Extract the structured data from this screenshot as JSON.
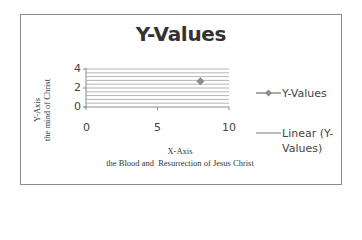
{
  "chart_data": {
    "type": "scatter",
    "title": "Y-Values",
    "xlabel": "X-Axis\nthe Blood and  Resurrection of Jesus Christ",
    "ylabel": "Y-Axis\nthe mind of Christ",
    "xlabel_line1": "X-Axis",
    "xlabel_line2": "the Blood and  Resurrection of Jesus Christ",
    "ylabel_line1": "Y-Axis",
    "ylabel_line2": "the mind of Christ",
    "xlim": [
      0,
      10
    ],
    "ylim": [
      0,
      4
    ],
    "xticks": [
      "0",
      "5",
      "10"
    ],
    "yticks": [
      "0",
      "2",
      "4"
    ],
    "grid": true,
    "grid_minor_step": 0.4,
    "legend_position": "right",
    "series": [
      {
        "name": "Y-Values",
        "x": [
          8
        ],
        "y": [
          2.7
        ],
        "marker": "diamond",
        "color": "#8c8c8c"
      },
      {
        "name": "Linear (Y-Values)",
        "type": "trendline",
        "color": "#8c8c8c"
      }
    ]
  },
  "legend": {
    "items": [
      {
        "label": "Y-Values"
      },
      {
        "label_line1": "Linear (Y-",
        "label_line2": "Values)"
      }
    ]
  },
  "colors": {
    "grid": "#b5b5b5",
    "axis": "#8c8c8c",
    "marker": "#8c8c8c",
    "text": "#333333"
  }
}
